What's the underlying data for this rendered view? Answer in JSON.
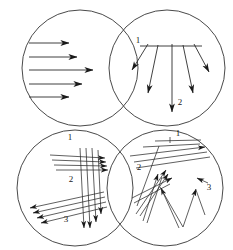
{
  "figure": {
    "background_color": "#ffffff",
    "circle_stroke_color": "#4a4a4a",
    "arrow_color": "#1a1a1a",
    "label_color": "#1a1a1a",
    "width": 233,
    "height": 250
  },
  "panels": [
    {
      "id": "panel-top-left",
      "position": "top-left",
      "pattern": "parallel-horizontal-arrows",
      "center": [
        80,
        68
      ],
      "radius": 58,
      "labels": [],
      "arrows": [
        {
          "x1": 29,
          "y1": 43,
          "x2": 69,
          "y2": 43
        },
        {
          "x1": 29,
          "y1": 57,
          "x2": 77,
          "y2": 57
        },
        {
          "x1": 29,
          "y1": 70,
          "x2": 93,
          "y2": 70
        },
        {
          "x1": 29,
          "y1": 84,
          "x2": 82,
          "y2": 84
        },
        {
          "x1": 29,
          "y1": 97,
          "x2": 69,
          "y2": 97
        }
      ]
    },
    {
      "id": "panel-top-right",
      "position": "top-right",
      "pattern": "radial-fan-downward-arrows",
      "center": [
        167,
        68
      ],
      "radius": 58,
      "labels": [
        {
          "text": "1",
          "x": 138,
          "y": 43
        },
        {
          "text": "2",
          "x": 180,
          "y": 105
        }
      ],
      "reference_line": {
        "x1": 140,
        "y1": 46,
        "x2": 202,
        "y2": 46
      },
      "arrows": [
        {
          "x1": 148,
          "y1": 44,
          "x2": 132,
          "y2": 70
        },
        {
          "x1": 158,
          "y1": 45,
          "x2": 148,
          "y2": 93
        },
        {
          "x1": 172,
          "y1": 44,
          "x2": 172,
          "y2": 112
        },
        {
          "x1": 183,
          "y1": 45,
          "x2": 193,
          "y2": 93
        },
        {
          "x1": 194,
          "y1": 44,
          "x2": 209,
          "y2": 72
        }
      ]
    },
    {
      "id": "panel-bottom-left",
      "position": "bottom-left",
      "pattern": "three-crossing-arrow-groups",
      "center": [
        75,
        188
      ],
      "radius": 58,
      "labels": [
        {
          "text": "1",
          "x": 70,
          "y": 140
        },
        {
          "text": "2",
          "x": 71,
          "y": 182
        },
        {
          "text": "3",
          "x": 66,
          "y": 222
        }
      ],
      "groups": [
        {
          "name": "group-1-up-right",
          "arrows": [
            {
              "x1": 50,
              "y1": 155,
              "x2": 105,
              "y2": 158
            },
            {
              "x1": 52,
              "y1": 160,
              "x2": 106,
              "y2": 162
            },
            {
              "x1": 54,
              "y1": 165,
              "x2": 107,
              "y2": 166
            },
            {
              "x1": 56,
              "y1": 170,
              "x2": 108,
              "y2": 170
            }
          ]
        },
        {
          "name": "group-2-down",
          "arrows": [
            {
              "x1": 80,
              "y1": 148,
              "x2": 84,
              "y2": 228
            },
            {
              "x1": 86,
              "y1": 148,
              "x2": 90,
              "y2": 228
            },
            {
              "x1": 92,
              "y1": 148,
              "x2": 96,
              "y2": 222
            },
            {
              "x1": 98,
              "y1": 150,
              "x2": 101,
              "y2": 214
            }
          ]
        },
        {
          "name": "group-3-down-left",
          "arrows": [
            {
              "x1": 104,
              "y1": 192,
              "x2": 30,
              "y2": 208
            },
            {
              "x1": 105,
              "y1": 197,
              "x2": 33,
              "y2": 213
            },
            {
              "x1": 106,
              "y1": 202,
              "x2": 37,
              "y2": 218
            },
            {
              "x1": 107,
              "y1": 207,
              "x2": 41,
              "y2": 223
            }
          ]
        }
      ]
    },
    {
      "id": "panel-bottom-right",
      "position": "bottom-right",
      "pattern": "random-chaotic-arrows",
      "center": [
        165,
        188
      ],
      "radius": 58,
      "labels": [
        {
          "text": "1",
          "x": 178,
          "y": 136
        },
        {
          "text": "2",
          "x": 139,
          "y": 170
        },
        {
          "text": "3",
          "x": 209,
          "y": 190
        }
      ],
      "arrows": [
        {
          "x1": 130,
          "y1": 156,
          "x2": 205,
          "y2": 147
        },
        {
          "x1": 134,
          "y1": 162,
          "x2": 207,
          "y2": 152
        },
        {
          "x1": 136,
          "y1": 168,
          "x2": 210,
          "y2": 157
        },
        {
          "x1": 143,
          "y1": 147,
          "x2": 200,
          "y2": 144
        },
        {
          "x1": 155,
          "y1": 141,
          "x2": 201,
          "y2": 140
        },
        {
          "x1": 170,
          "y1": 137,
          "x2": 170,
          "y2": 143
        },
        {
          "x1": 159,
          "y1": 146,
          "x2": 137,
          "y2": 206
        },
        {
          "x1": 136,
          "y1": 214,
          "x2": 166,
          "y2": 170
        },
        {
          "x1": 140,
          "y1": 216,
          "x2": 168,
          "y2": 174
        },
        {
          "x1": 132,
          "y1": 198,
          "x2": 172,
          "y2": 178
        },
        {
          "x1": 134,
          "y1": 203,
          "x2": 170,
          "y2": 184
        },
        {
          "x1": 143,
          "y1": 221,
          "x2": 158,
          "y2": 174
        },
        {
          "x1": 147,
          "y1": 223,
          "x2": 162,
          "y2": 177
        },
        {
          "x1": 179,
          "y1": 228,
          "x2": 161,
          "y2": 188
        },
        {
          "x1": 160,
          "y1": 187,
          "x2": 183,
          "y2": 227
        },
        {
          "x1": 183,
          "y1": 227,
          "x2": 196,
          "y2": 189
        },
        {
          "x1": 196,
          "y1": 190,
          "x2": 205,
          "y2": 215
        },
        {
          "x1": 208,
          "y1": 183,
          "x2": 197,
          "y2": 178
        }
      ]
    }
  ],
  "legend": {
    "panel_titles": {
      "top_left": "Parallel arrows",
      "top_right": "Diverging fan arrows",
      "bottom_left": "Grouped crossing arrows",
      "bottom_right": "Random arrows"
    }
  }
}
